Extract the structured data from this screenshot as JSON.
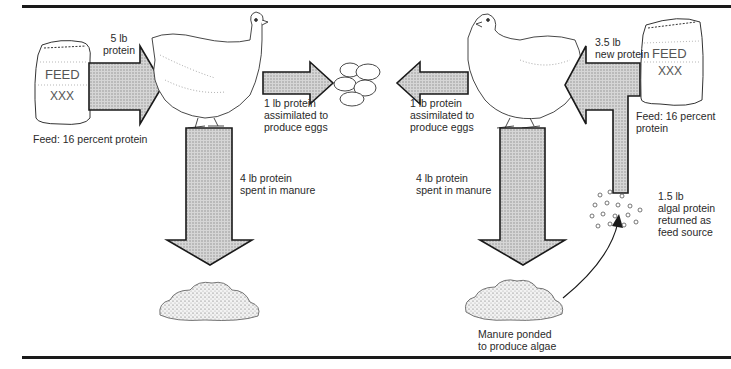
{
  "diagram": {
    "left_system": {
      "feed_bag": {
        "label": "FEED",
        "mark": "XXX"
      },
      "feed_caption": "Feed: 16 percent protein",
      "input_arrow": {
        "line1": "5 lb",
        "line2": "protein"
      },
      "eggs_arrow": {
        "line1": "1 lb protein",
        "line2": "assimilated to",
        "line3": "produce eggs"
      },
      "manure_arrow": {
        "line1": "4 lb protein",
        "line2": "spent in manure"
      }
    },
    "right_system": {
      "feed_bag": {
        "label": "FEED",
        "mark": "XXX"
      },
      "feed_caption": {
        "line1": "Feed: 16 percent",
        "line2": "protein"
      },
      "input_arrow": {
        "line1": "3.5 lb",
        "line2": "new protein"
      },
      "eggs_arrow": {
        "line1": "1 lb protein",
        "line2": "assimilated to",
        "line3": "produce eggs"
      },
      "manure_arrow": {
        "line1": "4 lb protein",
        "line2": "spent in manure"
      },
      "algae": {
        "line1": "1.5 lb",
        "line2": "algal protein",
        "line3": "returned as",
        "line4": "feed source"
      },
      "pond_caption": {
        "line1": "Manure ponded",
        "line2": "to produce algae"
      }
    },
    "colors": {
      "arrow_fill": "#c8c8c8",
      "outline": "#1a1a1a"
    }
  }
}
